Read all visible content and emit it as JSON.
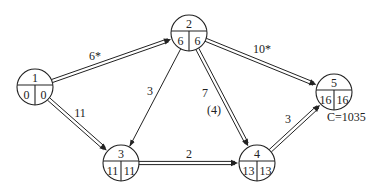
{
  "diagram": {
    "type": "network-planning-graph",
    "nodes": [
      {
        "id": "1",
        "x": 35,
        "y": 87,
        "early": "0",
        "late": "0"
      },
      {
        "id": "2",
        "x": 189,
        "y": 33,
        "early": "6",
        "late": "6"
      },
      {
        "id": "3",
        "x": 121,
        "y": 163,
        "early": "11",
        "late": "11"
      },
      {
        "id": "4",
        "x": 257,
        "y": 163,
        "early": "13",
        "late": "13"
      },
      {
        "id": "5",
        "x": 334,
        "y": 92,
        "early": "16",
        "late": "16"
      }
    ],
    "edges": [
      {
        "from": "1",
        "to": "2",
        "label": "6*",
        "critical": true,
        "label_x": 95,
        "label_y": 60
      },
      {
        "from": "1",
        "to": "3",
        "label": "11",
        "critical": true,
        "label_x": 80,
        "label_y": 117
      },
      {
        "from": "2",
        "to": "3",
        "label": "3",
        "critical": false,
        "label_x": 150,
        "label_y": 95
      },
      {
        "from": "2",
        "to": "4",
        "label": "7",
        "critical": true,
        "label_x": 205,
        "label_y": 97,
        "extra_label": "(4)",
        "extra_x": 214,
        "extra_y": 114
      },
      {
        "from": "2",
        "to": "5",
        "label": "10*",
        "critical": true,
        "label_x": 262,
        "label_y": 53
      },
      {
        "from": "3",
        "to": "4",
        "label": "2",
        "critical": true,
        "label_x": 189,
        "label_y": 158
      },
      {
        "from": "4",
        "to": "5",
        "label": "3",
        "critical": true,
        "label_x": 288,
        "label_y": 123
      }
    ],
    "cost_label": "C=1035",
    "cost_label_x": 327,
    "cost_label_y": 121
  }
}
